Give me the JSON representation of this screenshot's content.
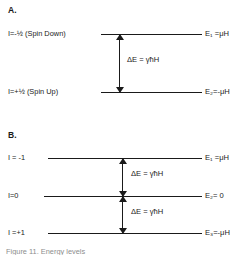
{
  "figure": {
    "title_caption": "Figure   11. Energy levels",
    "panels": [
      {
        "letter": "A.",
        "levels": [
          {
            "left_label": "I=-½ (Spin Down)",
            "right_label": "E₁ =μH"
          },
          {
            "left_label": "I=+½ (Spin Up)",
            "right_label": "E₂=-μH"
          }
        ],
        "transitions": [
          {
            "label": "ΔE = γħH"
          }
        ]
      },
      {
        "letter": "B.",
        "levels": [
          {
            "left_label": "I = -1",
            "right_label": "E₁ =μH"
          },
          {
            "left_label": "I=0",
            "right_label": "E₂= 0"
          },
          {
            "left_label": "I =+1",
            "right_label": "E₃=-μH"
          }
        ],
        "transitions": [
          {
            "label": "ΔE = γħH"
          },
          {
            "label": "ΔE = γħH"
          }
        ]
      }
    ],
    "colors": {
      "ink": "#1a1a1a",
      "background": "#ffffff",
      "caption": "#8d8d8d"
    }
  }
}
